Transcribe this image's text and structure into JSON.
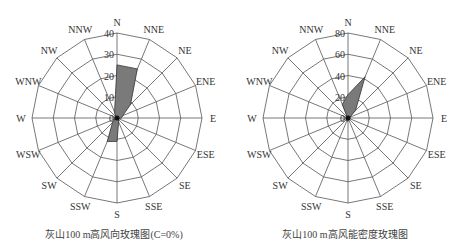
{
  "chart_data": [
    {
      "type": "radar",
      "subtype": "wind-rose",
      "title": "灰山100 m高风向玫瑰图(C=0%)",
      "directions": [
        "N",
        "NNE",
        "NE",
        "ENE",
        "E",
        "ESE",
        "SE",
        "SSE",
        "S",
        "SSW",
        "SW",
        "WSW",
        "W",
        "WNW",
        "NW",
        "NNW"
      ],
      "values": [
        25,
        25,
        9,
        3,
        2,
        1,
        1,
        2,
        11,
        12,
        3,
        1,
        1,
        1,
        1,
        3
      ],
      "unit": "%",
      "radial_ticks": [
        0,
        10,
        20,
        30,
        40
      ],
      "rmax": 40,
      "fill_color": "#7a7a7a",
      "grid": true
    },
    {
      "type": "radar",
      "subtype": "wind-rose",
      "title": "灰山100 m高风能密度玫瑰图",
      "directions": [
        "N",
        "NNE",
        "NE",
        "ENE",
        "E",
        "ESE",
        "SE",
        "SSE",
        "S",
        "SSW",
        "SW",
        "WSW",
        "W",
        "WNW",
        "NW",
        "NNW"
      ],
      "values": [
        22,
        42,
        10,
        2,
        1,
        1,
        1,
        1,
        3,
        3,
        1,
        1,
        1,
        1,
        1,
        14
      ],
      "unit": "%",
      "radial_ticks": [
        0,
        20,
        40,
        60,
        80
      ],
      "rmax": 80,
      "fill_color": "#7a7a7a",
      "grid": true
    }
  ],
  "charts": [
    {
      "caption": "灰山100 m高风向玫瑰图(C=0%)"
    },
    {
      "caption": "灰山100 m高风能密度玫瑰图"
    }
  ]
}
